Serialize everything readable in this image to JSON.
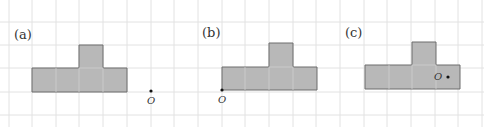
{
  "figure": {
    "panels": [
      {
        "label": "(a)",
        "point_label": "O"
      },
      {
        "label": "(b)",
        "point_label": "O"
      },
      {
        "label": "(c)",
        "point_label": "O"
      }
    ],
    "colors": {
      "shape_fill": "#b8b8b8",
      "shape_stroke": "#6d6d6d",
      "grid": "#e2e2e2"
    }
  }
}
